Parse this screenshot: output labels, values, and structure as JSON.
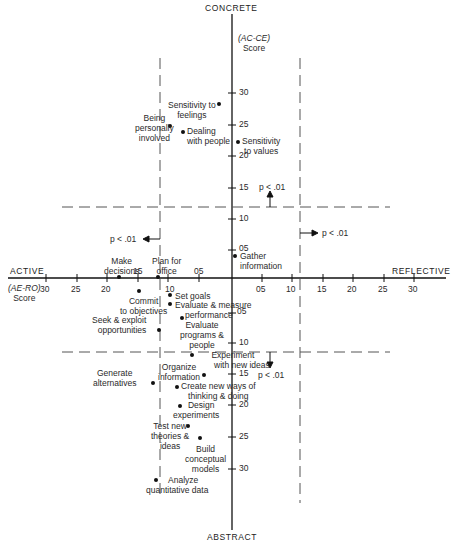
{
  "poles": {
    "top": "CONCRETE",
    "bottom": "ABSTRACT",
    "left": "ACTIVE",
    "right": "REFLECTIVE"
  },
  "axis_titles": {
    "vertical": {
      "line1": "(AC-CE)",
      "line2": "Score"
    },
    "horizontal": {
      "line1": "(AE-RO)",
      "line2": "Score"
    }
  },
  "x_ticks_left": [
    "30",
    "25",
    "20",
    "15",
    "10",
    "05"
  ],
  "x_ticks_right": [
    "05",
    "10",
    "15",
    "20",
    "25",
    "30"
  ],
  "y_ticks_up": [
    "30",
    "25",
    "20",
    "15",
    "10",
    "05"
  ],
  "y_ticks_down": [
    "05",
    "10",
    "15",
    "20",
    "25",
    "30"
  ],
  "significance": {
    "top": "p < .01",
    "left": "p < .01",
    "right": "p < .01",
    "bottom": "p < .01"
  },
  "points": [
    {
      "label": "Sensitivity to feelings"
    },
    {
      "label": "Being personally involved"
    },
    {
      "label": "Dealing with people"
    },
    {
      "label": "Sensitivity to values"
    },
    {
      "label": "Gather information"
    },
    {
      "label": "Make decisions"
    },
    {
      "label": "Plan for office"
    },
    {
      "label": "Commit to objectives"
    },
    {
      "label": "Set goals"
    },
    {
      "label": "Evaluate & measure performance"
    },
    {
      "label": "Seek & exploit opportunities"
    },
    {
      "label": "Evaluate programs & people"
    },
    {
      "label": "Experiment with new ideas"
    },
    {
      "label": "Organize information"
    },
    {
      "label": "Generate alternatives"
    },
    {
      "label": "Create new ways of thinking & doing"
    },
    {
      "label": "Design experiments"
    },
    {
      "label": "Test new theories & ideas"
    },
    {
      "label": "Build conceptual models"
    },
    {
      "label": "Analyze quantitative data"
    }
  ],
  "text": {
    "p1_sens_feel_a": "Sensitivity to",
    "p1_sens_feel_b": "feelings",
    "p2_being_a": "Being",
    "p2_being_b": "personally",
    "p2_being_c": "involved",
    "p3_deal_a": "Dealing",
    "p3_deal_b": "with people",
    "p4_values_a": "Sensitivity",
    "p4_values_b": "to values",
    "p5_gather_a": "Gather",
    "p5_gather_b": "information",
    "p6_make_a": "Make",
    "p6_make_b": "decisions",
    "p7_plan_a": "Plan for",
    "p7_plan_b": "office",
    "p8_commit_a": "Commit",
    "p8_commit_b": "to objectives",
    "p9_setgoals": "Set goals",
    "p10_evalmeas_a": "Evaluate & measure",
    "p10_evalmeas_b": "performance",
    "p11_seek_a": "Seek & exploit",
    "p11_seek_b": "opportunities",
    "p12_evalprog_a": "Evaluate",
    "p12_evalprog_b": "programs &",
    "p12_evalprog_c": "people",
    "p13_exp_a": "Experiment",
    "p13_exp_b": "with new ideas",
    "p14_org_a": "Organize",
    "p14_org_b": "information",
    "p15_gen_a": "Generate",
    "p15_gen_b": "alternatives",
    "p16_create_a": "Create new ways of",
    "p16_create_b": "thinking & doing",
    "p17_design_a": "Design",
    "p17_design_b": "experiments",
    "p18_test_a": "Test new",
    "p18_test_b": "theories &",
    "p18_test_c": "ideas",
    "p19_build_a": "Build",
    "p19_build_b": "conceptual",
    "p19_build_c": "models",
    "p20_analyze_a": "Analyze",
    "p20_analyze_b": "quantitative data"
  }
}
